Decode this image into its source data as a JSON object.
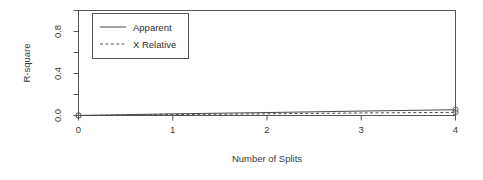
{
  "chart_data": {
    "type": "line",
    "title": "",
    "xlabel": "Number of Splits",
    "ylabel": "R-square",
    "x": [
      0,
      1,
      2,
      3,
      4
    ],
    "xlim": [
      0,
      4
    ],
    "ylim": [
      0,
      1.0
    ],
    "grid": false,
    "legend_position": "top-left",
    "xticks": [
      "0",
      "1",
      "2",
      "3",
      "4"
    ],
    "yticks": [
      "0.0",
      "0.4",
      "0.8"
    ],
    "ytick_values": [
      0.0,
      0.4,
      0.8
    ],
    "yminor_values": [
      0.2,
      0.6,
      1.0
    ],
    "markers": "open-circle",
    "marker_x": [
      0,
      4
    ],
    "series": [
      {
        "name": "Apparent",
        "style": "solid",
        "values": [
          0.0,
          0.016,
          0.028,
          0.042,
          0.055
        ]
      },
      {
        "name": "X Relative",
        "style": "dashed",
        "values": [
          0.0,
          0.009,
          0.016,
          0.024,
          0.03
        ]
      }
    ]
  },
  "legend": {
    "entries": [
      {
        "label": "Apparent",
        "style": "solid"
      },
      {
        "label": "X Relative",
        "style": "dashed"
      }
    ]
  },
  "colors": {
    "line": "#4a4a4a",
    "axis": "#555555",
    "text": "#3a3a3a",
    "background": "#ffffff"
  }
}
